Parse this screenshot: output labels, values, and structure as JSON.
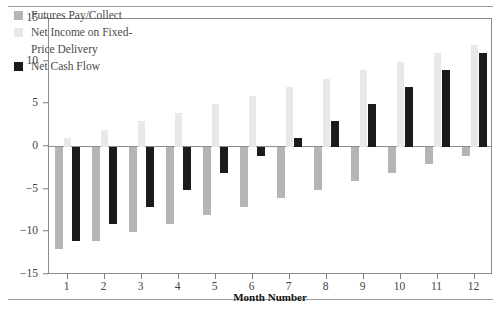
{
  "chart_data": {
    "type": "bar",
    "title": "",
    "xlabel": "Month Number",
    "ylabel": "Dollars (Thousands)",
    "categories": [
      "1",
      "2",
      "3",
      "4",
      "5",
      "6",
      "7",
      "8",
      "9",
      "10",
      "11",
      "12"
    ],
    "ylim": [
      -15,
      15
    ],
    "yticks": [
      15,
      10,
      5,
      0,
      -5,
      -10,
      -15
    ],
    "ytick_labels": [
      "15",
      "10",
      "5",
      "0",
      "−5",
      "−10",
      "−15"
    ],
    "grid": false,
    "zero_line": true,
    "legend_position": "upper-left-inside",
    "series": [
      {
        "name": "Futures Pay/Collect",
        "color": "#b5b5b5",
        "values": [
          -12,
          -11,
          -10,
          -9,
          -8,
          -7,
          -6,
          -5,
          -4,
          -3,
          -2,
          -1
        ]
      },
      {
        "name": "Net Income on Fixed-Price Delivery",
        "color": "#e8e8e8",
        "values": [
          1,
          2,
          3,
          4,
          5,
          6,
          7,
          8,
          9,
          10,
          11,
          12
        ]
      },
      {
        "name": "Net Cash Flow",
        "color": "#1b1b1b",
        "values": [
          -11,
          -9,
          -7,
          -5,
          -3,
          -1,
          1,
          3,
          5,
          7,
          9,
          11
        ]
      }
    ]
  },
  "legend": {
    "entries": [
      {
        "label": "Futures Pay/Collect",
        "swatch": "s0"
      },
      {
        "label": "Net Income on Fixed-",
        "label2": "Price Delivery",
        "swatch": "s1"
      },
      {
        "label": "Net Cash Flow",
        "swatch": "s2"
      }
    ]
  },
  "axes": {
    "y_title": "Dollars (Thousands)",
    "x_title": "Month Number"
  }
}
